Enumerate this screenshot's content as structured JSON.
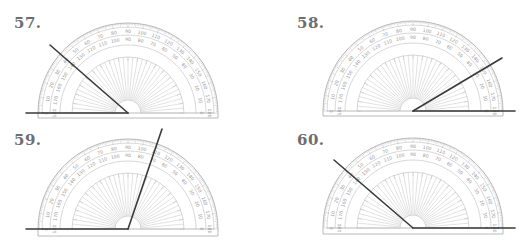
{
  "worksheet": {
    "problems": [
      {
        "number_label": "57.",
        "label_pos": {
          "x": 14,
          "y": 14
        },
        "protractor": {
          "cx": 128,
          "cy": 113,
          "r": 90,
          "bottom_edge_y": 118
        },
        "rays": [
          {
            "x1": 128,
            "y1": 113,
            "x2": 26,
            "y2": 113
          },
          {
            "x1": 128,
            "y1": 113,
            "x2": 50,
            "y2": 45
          }
        ],
        "angle_degrees_outer_scale": 139
      },
      {
        "number_label": "58.",
        "label_pos": {
          "x": 297,
          "y": 14
        },
        "protractor": {
          "cx": 413,
          "cy": 111,
          "r": 90,
          "bottom_edge_y": 116
        },
        "rays": [
          {
            "x1": 413,
            "y1": 111,
            "x2": 515,
            "y2": 111
          },
          {
            "x1": 413,
            "y1": 111,
            "x2": 502,
            "y2": 58
          }
        ],
        "angle_degrees_inner_scale": 31
      },
      {
        "number_label": "59.",
        "label_pos": {
          "x": 14,
          "y": 131
        },
        "protractor": {
          "cx": 128,
          "cy": 229,
          "r": 90,
          "bottom_edge_y": 236
        },
        "rays": [
          {
            "x1": 128,
            "y1": 229,
            "x2": 26,
            "y2": 229
          },
          {
            "x1": 128,
            "y1": 229,
            "x2": 162,
            "y2": 129
          }
        ],
        "angle_degrees_outer_scale": 109
      },
      {
        "number_label": "60.",
        "label_pos": {
          "x": 297,
          "y": 131
        },
        "protractor": {
          "cx": 413,
          "cy": 228,
          "r": 90,
          "bottom_edge_y": 234
        },
        "rays": [
          {
            "x1": 413,
            "y1": 228,
            "x2": 515,
            "y2": 228
          },
          {
            "x1": 413,
            "y1": 228,
            "x2": 334,
            "y2": 160
          }
        ],
        "angle_degrees_inner_scale": 139
      }
    ],
    "scale": {
      "outer_labels": [
        "0",
        "10",
        "20",
        "30",
        "40",
        "50",
        "60",
        "70",
        "80",
        "90",
        "100",
        "110",
        "120",
        "130",
        "140",
        "150",
        "160",
        "170",
        "180"
      ],
      "inner_labels": [
        "180",
        "170",
        "160",
        "150",
        "140",
        "130",
        "120",
        "110",
        "100",
        "90",
        "80",
        "70",
        "60",
        "50",
        "40",
        "30",
        "20",
        "10",
        "0"
      ]
    },
    "colors": {
      "label": "#6e6e6e",
      "ray": "#3a3a3a",
      "protractor_line": "#9a9a9a",
      "background": "#ffffff"
    }
  }
}
